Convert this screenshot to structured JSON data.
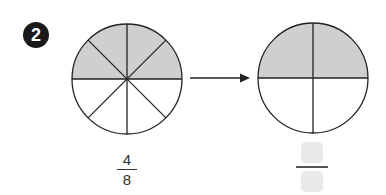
{
  "problem": {
    "number": "2"
  },
  "left_circle": {
    "parts": 8,
    "shaded": 4,
    "fraction": {
      "numerator": "4",
      "denominator": "8"
    }
  },
  "right_circle": {
    "parts": 4,
    "shaded": 2,
    "fraction": {
      "numerator": "",
      "denominator": ""
    }
  },
  "colors": {
    "shade": "#cfcfcf",
    "stroke": "#222222",
    "answer_box": "#e9e9e9"
  }
}
